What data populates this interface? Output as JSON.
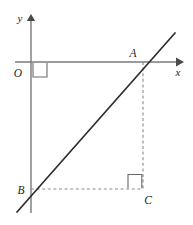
{
  "figure": {
    "background_color": "#ffffff",
    "width": 193,
    "height": 225,
    "colors": {
      "axis": "#7a7a7a",
      "line": "#2e2e2e",
      "dashed": "#8a8a8a",
      "right_angle": "#6a6a6a",
      "label": "#1d1d1d"
    },
    "axes": {
      "x_axis": {
        "label": "x",
        "label_x": 177,
        "label_y": 74,
        "y": 62,
        "x_start": 15,
        "x_end": 178,
        "arrow": "right"
      },
      "y_axis": {
        "label": "y",
        "label_x": 20,
        "label_y": 21,
        "x": 31,
        "y_start": 17,
        "y_end": 213,
        "arrow": "up"
      },
      "origin": {
        "label": "O",
        "label_x": 18,
        "label_y": 76,
        "x": 31,
        "y": 62
      }
    },
    "points": [
      {
        "name": "A",
        "label": "A",
        "x": 143,
        "y": 62,
        "label_x": 132,
        "label_y": 57,
        "description": "intersection of line with x-axis"
      },
      {
        "name": "B",
        "label": "B",
        "x": 31,
        "y": 189,
        "label_x": 19,
        "label_y": 193,
        "description": "intersection of line with y-axis"
      },
      {
        "name": "C",
        "label": "C",
        "x": 143,
        "y": 189,
        "label_x": 146,
        "label_y": 203,
        "description": "right-angle vertex of triangle"
      }
    ],
    "segments": {
      "main_line": {
        "x1": 17,
        "y1": 212,
        "x2": 175,
        "y2": 33,
        "style": "solid",
        "description": "line through B and A"
      },
      "dashed_vertical": {
        "x1": 143,
        "y1": 62,
        "x2": 143,
        "y2": 189,
        "style": "dashed",
        "description": "A to C"
      },
      "dashed_horizontal": {
        "x1": 31,
        "y1": 189,
        "x2": 143,
        "y2": 189,
        "style": "dashed",
        "description": "B to C"
      }
    },
    "right_angle_marks": [
      {
        "name": "origin-right-angle",
        "path": "M 33 62 L 33 76 L 47 76 L 47 62",
        "at": "O"
      },
      {
        "name": "vertex-c-right-angle",
        "path": "M 128 189 L 128 175 L 142 175 L 142 189",
        "at": "C"
      }
    ]
  }
}
